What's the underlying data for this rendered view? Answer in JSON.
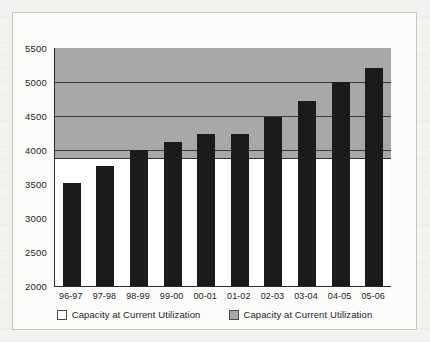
{
  "chart_data": {
    "type": "bar",
    "title": "",
    "xlabel": "",
    "ylabel": "",
    "ylim": [
      2000,
      5500
    ],
    "ytick_step": 500,
    "yticks": [
      "2000",
      "2500",
      "3000",
      "3500",
      "4000",
      "4500",
      "5000",
      "5500"
    ],
    "grid": true,
    "gridlines_at": [
      4000,
      4500,
      5000
    ],
    "legend_position": "bottom-center",
    "categories": [
      "96-97",
      "97-98",
      "98-99",
      "99-00",
      "00-01",
      "01-02",
      "02-03",
      "03-04",
      "04-05",
      "05-06"
    ],
    "series": [
      {
        "name": "Capacity at Current Utilization",
        "values": [
          3520,
          3760,
          4000,
          4120,
          4240,
          4240,
          4490,
          4720,
          5000,
          5200
        ]
      }
    ],
    "capacity_band": {
      "name": "Capacity at Current Utilization",
      "from": 3880,
      "to": 5500
    },
    "annotations": []
  },
  "colors": {
    "bar": "#1b1b1b",
    "band": "#a8a8a8",
    "plot_background": "#ffffff",
    "axis": "#2b2b2b",
    "gridline": "#3a3a3a",
    "frame_border": "#c9c7c4",
    "page_background": "#f3f2f0",
    "text": "#1c1c1c"
  },
  "legend": {
    "entries": [
      {
        "label": "Capacity at Current Utilization",
        "swatch": "white"
      },
      {
        "label": "Capacity at Current Utilization",
        "swatch": "gray"
      }
    ]
  }
}
